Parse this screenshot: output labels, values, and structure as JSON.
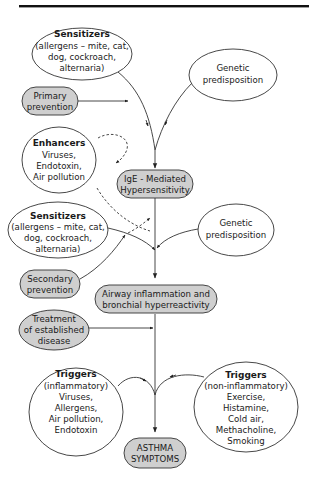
{
  "diagram": {
    "title": "",
    "nodes": {
      "sensitizers_1": {
        "title": "Sensitizers",
        "lines": [
          "(allergens – mite, cat,",
          "dog, cockroach,",
          "alternaria)"
        ]
      },
      "genetic_1": {
        "lines": [
          "Genetic",
          "predisposition"
        ]
      },
      "primary_prevention": {
        "lines": [
          "Primary",
          "prevention"
        ]
      },
      "enhancers": {
        "title": "Enhancers",
        "lines": [
          "Viruses,",
          "Endotoxin,",
          "Air pollution"
        ]
      },
      "ige": {
        "lines": [
          "IgE - Mediated",
          "Hypersensitivity"
        ]
      },
      "sensitizers_2": {
        "title": "Sensitizers",
        "lines": [
          "(allergens – mite, cat,",
          "dog, cockroach,",
          "alternaria)"
        ]
      },
      "genetic_2": {
        "lines": [
          "Genetic",
          "predisposition"
        ]
      },
      "secondary_prevention": {
        "lines": [
          "Secondary",
          "prevention"
        ]
      },
      "airway": {
        "lines": [
          "Airway inflammation and",
          "bronchial hyperreactivity"
        ]
      },
      "treatment": {
        "lines": [
          "Treatment",
          "of established",
          "disease"
        ]
      },
      "triggers_inflammatory": {
        "title": "Triggers",
        "lines": [
          "(inflammatory)",
          "Viruses,",
          "Allergens,",
          "Air pollution,",
          "Endotoxin"
        ]
      },
      "triggers_noninflammatory": {
        "title": "Triggers",
        "lines": [
          "(non-inflammatory)",
          "Exercise,",
          "Histamine,",
          "Cold air,",
          "Methacholine,",
          "Smoking"
        ]
      },
      "asthma": {
        "lines": [
          "ASTHMA",
          "SYMPTOMS"
        ]
      }
    },
    "colors": {
      "gray_fill": "#cfcfcf",
      "stroke": "#333333",
      "background": "#ffffff"
    }
  }
}
